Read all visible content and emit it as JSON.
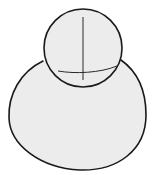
{
  "figure": {
    "colors": {
      "fill": "#ececec",
      "stroke": "#1a1a1a",
      "guide": "#2a2a2a",
      "background": "#ffffff"
    },
    "shapes": [
      {
        "name": "body-oval",
        "type": "closed-curve"
      },
      {
        "name": "head-circle",
        "type": "circle",
        "cx": 83,
        "cy": 48,
        "r": 39
      },
      {
        "name": "vertical-guide",
        "type": "line"
      },
      {
        "name": "horizontal-guide",
        "type": "curve"
      }
    ]
  }
}
